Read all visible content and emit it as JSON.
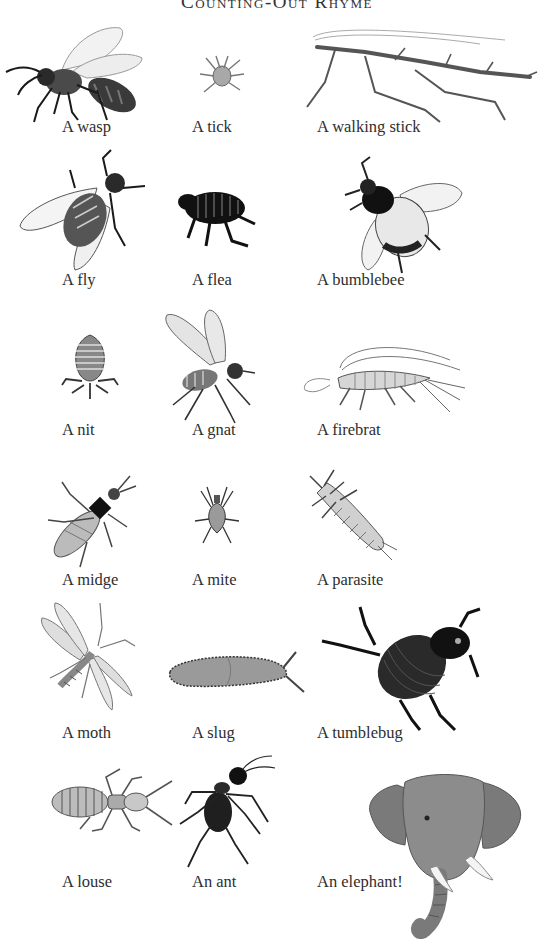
{
  "page": {
    "title": "Counting-Out Rhyme"
  },
  "rows": [
    {
      "items": [
        {
          "label": "A wasp",
          "icon": "wasp-illustration"
        },
        {
          "label": "A tick",
          "icon": "tick-illustration"
        },
        {
          "label": "A walking stick",
          "icon": "walking-stick-illustration"
        }
      ]
    },
    {
      "items": [
        {
          "label": "A fly",
          "icon": "fly-illustration"
        },
        {
          "label": "A flea",
          "icon": "flea-illustration"
        },
        {
          "label": "A bumblebee",
          "icon": "bumblebee-illustration"
        }
      ]
    },
    {
      "items": [
        {
          "label": "A nit",
          "icon": "nit-illustration"
        },
        {
          "label": "A gnat",
          "icon": "gnat-illustration"
        },
        {
          "label": "A firebrat",
          "icon": "firebrat-illustration"
        }
      ]
    },
    {
      "items": [
        {
          "label": "A midge",
          "icon": "midge-illustration"
        },
        {
          "label": "A mite",
          "icon": "mite-illustration"
        },
        {
          "label": "A parasite",
          "icon": "parasite-illustration"
        }
      ]
    },
    {
      "items": [
        {
          "label": "A moth",
          "icon": "moth-illustration"
        },
        {
          "label": "A slug",
          "icon": "slug-illustration"
        },
        {
          "label": "A tumblebug",
          "icon": "tumblebug-illustration"
        }
      ]
    },
    {
      "items": [
        {
          "label": "A louse",
          "icon": "louse-illustration"
        },
        {
          "label": "An ant",
          "icon": "ant-illustration"
        },
        {
          "label": "An elephant!",
          "icon": "elephant-illustration"
        }
      ]
    }
  ],
  "colors": {
    "background": "#ffffff",
    "text": "#2e2e2e",
    "ink_dark": "#1a1a1a",
    "ink_mid": "#6e6e6e",
    "ink_light": "#bdbdbd"
  }
}
